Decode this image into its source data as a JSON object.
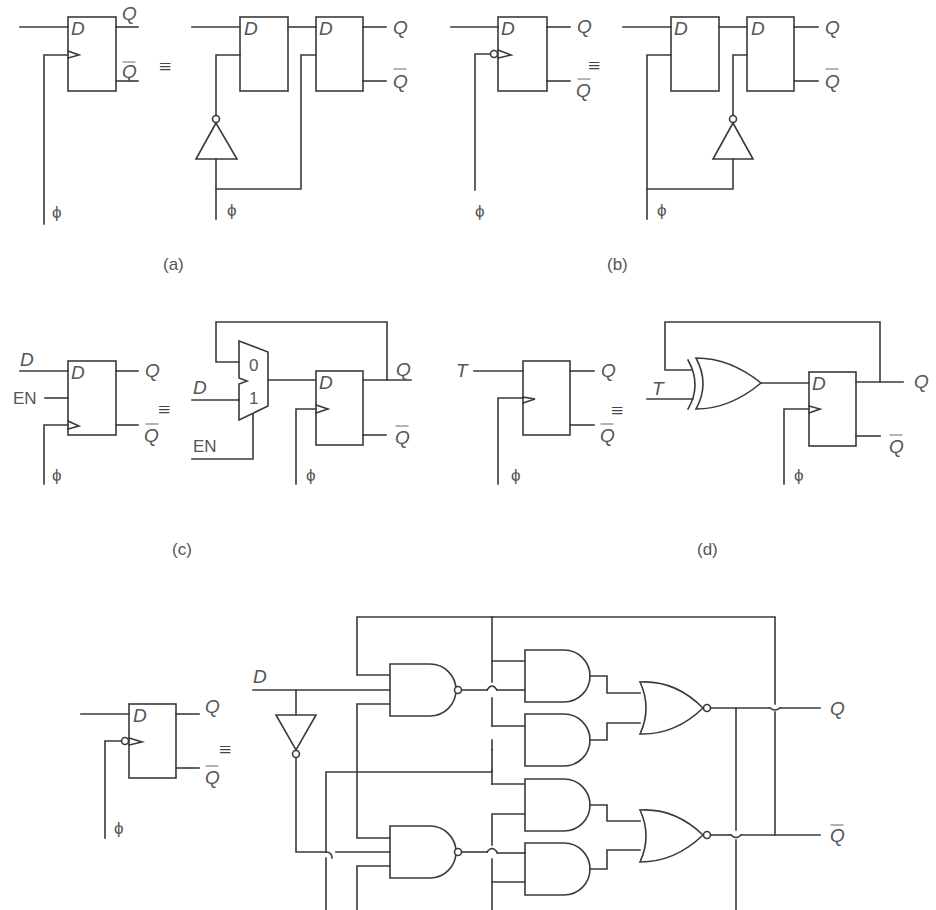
{
  "figure": {
    "panels": [
      {
        "id": "a",
        "caption": "(a)",
        "description": "Positive edge-triggered D flip-flop equals two cascaded latches with inverted clock on master"
      },
      {
        "id": "b",
        "caption": "(b)",
        "description": "Negative edge-triggered D flip-flop equals two cascaded latches with inverted clock on slave"
      },
      {
        "id": "c",
        "caption": "(c)",
        "description": "D flip-flop with enable equals multiplexer feeding D flip-flop"
      },
      {
        "id": "d",
        "caption": "(d)",
        "description": "T flip-flop equals XOR gate feeding D flip-flop"
      },
      {
        "id": "e",
        "caption": "",
        "description": "Negative edge-triggered D flip-flop gate-level implementation with NAND, AND, NOR gates"
      }
    ]
  },
  "labels": {
    "D": "D",
    "Q": "Q",
    "Qbar": "Q",
    "phi": "ϕ",
    "EN": "EN",
    "T": "T",
    "equiv": "≡",
    "mux0": "0",
    "mux1": "1"
  },
  "captions": {
    "a": "(a)",
    "b": "(b)",
    "c": "(c)",
    "d": "(d)"
  },
  "colors": {
    "line": "#3a3a3a",
    "text": "#555555",
    "background": "#ffffff"
  }
}
